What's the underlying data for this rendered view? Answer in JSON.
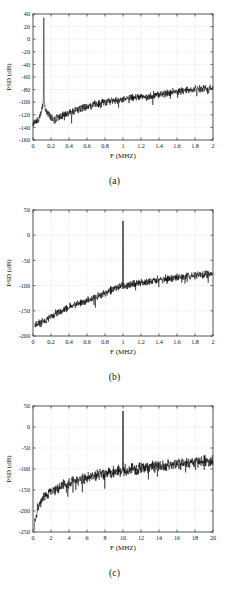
{
  "figure": {
    "panels": [
      {
        "caption": "(a)",
        "xlabel": "F (MHZ)",
        "ylabel": "PSD (dB)"
      },
      {
        "caption": "(b)",
        "xlabel": "F (MHZ)",
        "ylabel": "PSD (dB)"
      },
      {
        "caption": "(c)",
        "xlabel": "F (MHZ)",
        "ylabel": "PSD (dB)"
      }
    ]
  },
  "chart_data": [
    {
      "type": "line",
      "panel": "(a)",
      "title": "",
      "xlabel": "F (MHZ)",
      "ylabel": "PSD (dB)",
      "xlim": [
        0,
        2
      ],
      "ylim": [
        -160,
        40
      ],
      "xticks": [
        0,
        0.2,
        0.4,
        0.6,
        0.8,
        1,
        1.2,
        1.4,
        1.6,
        1.8,
        2
      ],
      "xticklabels": [
        "0",
        "0.2",
        "0.4",
        "0.6",
        "0.8",
        "1",
        "1.2",
        "1.4",
        "1.6",
        "1.8",
        "2"
      ],
      "yticks": [
        -160,
        -140,
        -120,
        -100,
        -80,
        -60,
        -40,
        -20,
        0,
        20,
        40
      ],
      "yticklabels": [
        "-160",
        "-140",
        "-120",
        "-100",
        "-80",
        "-60",
        "-40",
        "-20",
        "0",
        "20",
        "40"
      ],
      "grid": true,
      "legend": null,
      "series": [
        {
          "name": "PSD",
          "color": "#000000",
          "tone_freq": 0.12,
          "tone_peak": 34,
          "noise_seed": 17,
          "noise_band": 7,
          "baseline_points": [
            [
              0.0,
              -133
            ],
            [
              0.02,
              -132
            ],
            [
              0.05,
              -130
            ],
            [
              0.08,
              -121
            ],
            [
              0.1,
              -108
            ],
            [
              0.115,
              -104
            ],
            [
              0.12,
              34
            ],
            [
              0.125,
              -104
            ],
            [
              0.14,
              -110
            ],
            [
              0.17,
              -118
            ],
            [
              0.2,
              -124
            ],
            [
              0.24,
              -128
            ],
            [
              0.28,
              -124
            ],
            [
              0.34,
              -120
            ],
            [
              0.4,
              -116
            ],
            [
              0.5,
              -112
            ],
            [
              0.6,
              -107
            ],
            [
              0.7,
              -103
            ],
            [
              0.8,
              -100
            ],
            [
              0.9,
              -97
            ],
            [
              1.0,
              -95
            ],
            [
              1.1,
              -93
            ],
            [
              1.2,
              -92
            ],
            [
              1.3,
              -90
            ],
            [
              1.4,
              -88
            ],
            [
              1.5,
              -85
            ],
            [
              1.6,
              -83
            ],
            [
              1.7,
              -81
            ],
            [
              1.8,
              -79
            ],
            [
              1.9,
              -78
            ],
            [
              2.0,
              -77
            ]
          ]
        }
      ]
    },
    {
      "type": "line",
      "panel": "(b)",
      "title": "",
      "xlabel": "F (MHZ)",
      "ylabel": "PSD (dB)",
      "xlim": [
        0,
        2
      ],
      "ylim": [
        -200,
        50
      ],
      "xticks": [
        0,
        0.2,
        0.4,
        0.6,
        0.8,
        1,
        1.2,
        1.4,
        1.6,
        1.8,
        2
      ],
      "xticklabels": [
        "0",
        "0.2",
        "0.4",
        "0.6",
        "0.8",
        "1",
        "1.2",
        "1.4",
        "1.6",
        "1.8",
        "2"
      ],
      "yticks": [
        -200,
        -150,
        -100,
        -50,
        0,
        50
      ],
      "yticklabels": [
        "-200",
        "-150",
        "-100",
        "-50",
        "0",
        "50"
      ],
      "grid": true,
      "legend": null,
      "series": [
        {
          "name": "PSD",
          "color": "#000000",
          "tone_freq": 1.0,
          "tone_peak": 28,
          "noise_seed": 43,
          "noise_band": 9,
          "baseline_points": [
            [
              0.02,
              -178
            ],
            [
              0.05,
              -176
            ],
            [
              0.08,
              -174
            ],
            [
              0.12,
              -171
            ],
            [
              0.16,
              -166
            ],
            [
              0.2,
              -161
            ],
            [
              0.25,
              -156
            ],
            [
              0.3,
              -151
            ],
            [
              0.35,
              -147
            ],
            [
              0.4,
              -143
            ],
            [
              0.45,
              -139
            ],
            [
              0.5,
              -136
            ],
            [
              0.55,
              -133
            ],
            [
              0.6,
              -130
            ],
            [
              0.65,
              -127
            ],
            [
              0.7,
              -123
            ],
            [
              0.75,
              -119
            ],
            [
              0.8,
              -115
            ],
            [
              0.85,
              -110
            ],
            [
              0.9,
              -106
            ],
            [
              0.95,
              -103
            ],
            [
              1.0,
              -101
            ],
            [
              1.05,
              -99
            ],
            [
              1.1,
              -97
            ],
            [
              1.2,
              -94
            ],
            [
              1.3,
              -91
            ],
            [
              1.4,
              -88
            ],
            [
              1.5,
              -86
            ],
            [
              1.6,
              -84
            ],
            [
              1.7,
              -82
            ],
            [
              1.8,
              -80
            ],
            [
              1.9,
              -78
            ],
            [
              2.0,
              -76
            ]
          ]
        }
      ]
    },
    {
      "type": "line",
      "panel": "(c)",
      "title": "",
      "xlabel": "F (MHZ)",
      "ylabel": "PSD (dB)",
      "xlim": [
        0,
        20
      ],
      "ylim": [
        -250,
        50
      ],
      "xticks": [
        0,
        2,
        4,
        6,
        8,
        10,
        12,
        14,
        16,
        18,
        20
      ],
      "xticklabels": [
        "0",
        "2",
        "4",
        "6",
        "8",
        "10",
        "12",
        "14",
        "16",
        "18",
        "20"
      ],
      "yticks": [
        -250,
        -200,
        -150,
        -100,
        -50,
        0,
        50
      ],
      "yticklabels": [
        "-250",
        "-200",
        "-150",
        "-100",
        "-50",
        "0",
        "50"
      ],
      "grid": true,
      "legend": null,
      "series": [
        {
          "name": "PSD",
          "color": "#000000",
          "tone_freq": 10.0,
          "tone_peak": 38,
          "noise_seed": 91,
          "noise_band": 16,
          "baseline_points": [
            [
              0.15,
              -238
            ],
            [
              0.3,
              -215
            ],
            [
              0.5,
              -196
            ],
            [
              0.8,
              -180
            ],
            [
              1.2,
              -168
            ],
            [
              1.6,
              -160
            ],
            [
              2.0,
              -153
            ],
            [
              2.5,
              -147
            ],
            [
              3.0,
              -142
            ],
            [
              3.5,
              -137
            ],
            [
              4.0,
              -133
            ],
            [
              5.0,
              -126
            ],
            [
              6.0,
              -120
            ],
            [
              7.0,
              -115
            ],
            [
              8.0,
              -111
            ],
            [
              9.0,
              -107
            ],
            [
              10.0,
              -104
            ],
            [
              11.0,
              -101
            ],
            [
              12.0,
              -98
            ],
            [
              13.0,
              -95
            ],
            [
              14.0,
              -92
            ],
            [
              15.0,
              -90
            ],
            [
              16.0,
              -88
            ],
            [
              17.0,
              -86
            ],
            [
              18.0,
              -84
            ],
            [
              19.0,
              -82
            ],
            [
              20.0,
              -80
            ]
          ]
        }
      ]
    }
  ]
}
